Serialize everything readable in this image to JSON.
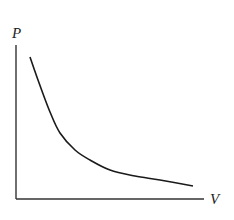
{
  "chart_data": {
    "type": "line",
    "title": "",
    "xlabel": "V",
    "ylabel": "P",
    "grid": false,
    "legend": null,
    "ticks": {
      "x": [],
      "y": []
    },
    "series": [
      {
        "name": "P-V curve",
        "relation": "P = k / V",
        "points_px": [
          [
            30,
            57
          ],
          [
            38,
            80
          ],
          [
            50,
            112
          ],
          [
            60,
            133
          ],
          [
            75,
            150
          ],
          [
            90,
            160
          ],
          [
            110,
            170
          ],
          [
            135,
            176
          ],
          [
            160,
            180
          ],
          [
            193,
            186
          ]
        ]
      }
    ],
    "axes": {
      "origin_px": [
        16,
        199
      ],
      "x_end_px": [
        204,
        199
      ],
      "y_end_px": [
        16,
        45
      ]
    }
  },
  "labels": {
    "y_axis": "P",
    "x_axis": "V"
  },
  "colors": {
    "line": "#1a1a1a",
    "axis": "#333333",
    "background": "#ffffff"
  }
}
